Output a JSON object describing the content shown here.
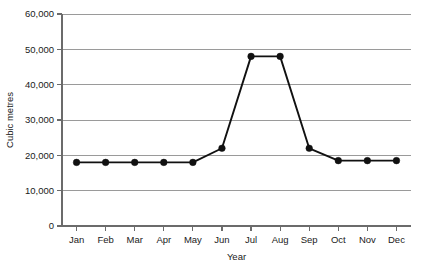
{
  "chart_data": {
    "type": "line",
    "title": "",
    "subtitle": "",
    "xlabel": "Year",
    "ylabel": "Cubic metres",
    "categories": [
      "Jan",
      "Feb",
      "Mar",
      "Apr",
      "May",
      "Jun",
      "Jul",
      "Aug",
      "Sep",
      "Oct",
      "Nov",
      "Dec"
    ],
    "values": [
      18000,
      18000,
      18000,
      18000,
      18000,
      22000,
      48000,
      48000,
      22000,
      18500,
      18500,
      18500
    ],
    "series": [
      {
        "name": "Cubic metres",
        "values": [
          18000,
          18000,
          18000,
          18000,
          18000,
          22000,
          48000,
          48000,
          22000,
          18500,
          18500,
          18500
        ]
      }
    ],
    "ylim": [
      0,
      60000
    ],
    "y_ticks": [
      0,
      10000,
      20000,
      30000,
      40000,
      50000,
      60000
    ],
    "y_tick_labels": [
      "0",
      "10,000",
      "20,000",
      "30,000",
      "40,000",
      "50,000",
      "60,000"
    ],
    "x_tick_labels": [
      "Jan",
      "Feb",
      "Mar",
      "Apr",
      "May",
      "Jun",
      "Jul",
      "Aug",
      "Sep",
      "Oct",
      "Nov",
      "Dec"
    ],
    "grid": "horizontal",
    "legend": "none",
    "marker": "filled-circle",
    "line_color": "#111111",
    "grid_color": "#9a9a9a",
    "axis_color": "#6b6b6b",
    "background": "#ffffff"
  },
  "axis_titles": {
    "y": "Cubic metres",
    "x": "Year"
  }
}
